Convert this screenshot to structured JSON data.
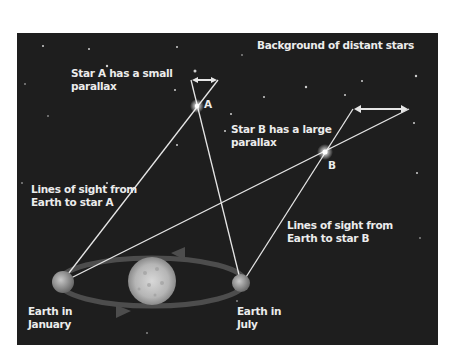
{
  "figure": {
    "clipped_caption": "",
    "labels": {
      "background": "Background of distant stars",
      "star_a_note_line1": "Star A has a small",
      "star_a_note_line2": "parallax",
      "star_a": "A",
      "star_b_note_line1": "Star B has a large",
      "star_b_note_line2": "parallax",
      "star_b": "B",
      "sight_a_line1": "Lines of sight from",
      "sight_a_line2": "Earth to star A",
      "sight_b_line1": "Lines of sight from",
      "sight_b_line2": "Earth to star B",
      "earth_jan_line1": "Earth in",
      "earth_jan_line2": "January",
      "earth_jul_line1": "Earth in",
      "earth_jul_line2": "July"
    },
    "colors": {
      "background": "#1e1e1e",
      "line": "#e6e6e6",
      "orbit": "#4a4a4a",
      "text": "#ececec"
    }
  }
}
